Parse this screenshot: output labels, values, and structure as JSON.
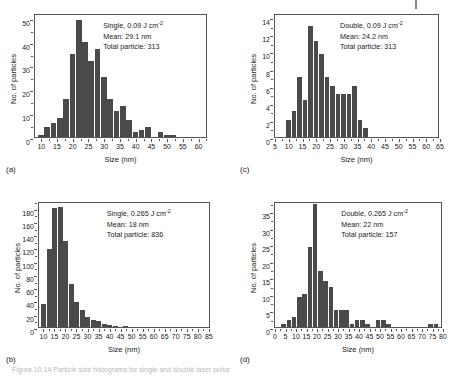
{
  "figure": {
    "caption": "Figure 10.14  Particle size histograms for single and double laser pulse",
    "top_mark": "page-edge-mark"
  },
  "chart_data": [
    {
      "id": "a",
      "type": "bar",
      "panel_letter": "(a)",
      "title": "",
      "xlabel": "Size (nm)",
      "ylabel": "No. of particles",
      "annotation": {
        "condition": "Single, 0.09 J cm",
        "condition_exp": "-2",
        "mean": "Mean: 29.1 nm",
        "total": "Total particle: 313"
      },
      "xlim": [
        8,
        63
      ],
      "ylim": [
        0,
        52
      ],
      "xticks": [
        10,
        15,
        20,
        25,
        30,
        35,
        40,
        45,
        50,
        55,
        60
      ],
      "yticks": [
        0,
        10,
        20,
        30,
        40,
        50
      ],
      "bin_width": 2,
      "bin_starts": [
        9,
        11,
        13,
        15,
        17,
        19,
        21,
        23,
        25,
        27,
        29,
        31,
        33,
        35,
        37,
        39,
        41,
        43,
        45,
        47,
        49,
        51,
        53,
        55,
        57,
        59,
        61
      ],
      "values": [
        1,
        4,
        6,
        8,
        16,
        35,
        49,
        40,
        32,
        37,
        25,
        16,
        11,
        13,
        7,
        2,
        3,
        4,
        0,
        2,
        1,
        1
      ]
    },
    {
      "id": "c",
      "type": "bar",
      "panel_letter": "(c)",
      "title": "",
      "xlabel": "Size (nm)",
      "ylabel": "No. of particles",
      "annotation": {
        "condition": "Double, 0.09 J cm",
        "condition_exp": "-2",
        "mean": "Mean: 24.2 nm",
        "total": "Total particle: 313"
      },
      "xlim": [
        5,
        65
      ],
      "ylim": [
        0,
        14.5
      ],
      "xticks": [
        5,
        10,
        15,
        20,
        25,
        30,
        35,
        40,
        45,
        50,
        55,
        60,
        65
      ],
      "yticks": [
        0,
        2,
        4,
        6,
        8,
        10,
        12,
        14
      ],
      "bin_width": 2,
      "bin_starts": [
        9,
        11,
        13,
        15,
        17,
        19,
        21,
        23,
        25,
        27,
        29,
        31,
        33,
        35,
        37,
        63
      ],
      "values": [
        2,
        3,
        7,
        4.3,
        13,
        11.2,
        9.7,
        7,
        6,
        5,
        5,
        5,
        6,
        2,
        1
      ]
    },
    {
      "id": "b",
      "type": "bar",
      "panel_letter": "(b)",
      "title": "",
      "xlabel": "Size (nm)",
      "ylabel": "No. of particles",
      "annotation": {
        "condition": "Single, 0.265 J cm",
        "condition_exp": "-2",
        "mean": "Mean: 18 nm",
        "total": "Total particle: 836"
      },
      "xlim": [
        8,
        86
      ],
      "ylim": [
        0,
        190
      ],
      "xticks": [
        10,
        15,
        20,
        25,
        30,
        35,
        40,
        45,
        50,
        55,
        60,
        65,
        70,
        75,
        80,
        85
      ],
      "yticks": [
        0,
        20,
        40,
        60,
        80,
        100,
        120,
        140,
        160,
        180
      ],
      "bin_width": 2.5,
      "bin_starts": [
        9,
        11.5,
        14,
        16.5,
        19,
        21.5,
        24,
        26.5,
        29,
        31.5,
        34,
        36.5,
        39,
        41.5,
        46
      ],
      "values": [
        34,
        117,
        180,
        181,
        129,
        65,
        37,
        26,
        15,
        10,
        9,
        4,
        3,
        2,
        2
      ]
    },
    {
      "id": "d",
      "type": "bar",
      "panel_letter": "(d)",
      "title": "",
      "xlabel": "Size (nm)",
      "ylabel": "No. of particles",
      "annotation": {
        "condition": "Double, 0.265 J cm",
        "condition_exp": "-2",
        "mean": "Mean: 22 nm",
        "total": "Total particle: 157"
      },
      "xlim": [
        0,
        80
      ],
      "ylim": [
        0,
        38
      ],
      "xticks": [
        0,
        5,
        10,
        15,
        20,
        25,
        30,
        35,
        40,
        45,
        50,
        55,
        60,
        65,
        70,
        75,
        80
      ],
      "yticks": [
        0,
        5,
        10,
        15,
        20,
        25,
        30,
        35
      ],
      "bin_width": 2.5,
      "bin_starts": [
        3,
        5.5,
        8,
        10.5,
        13,
        15.5,
        18,
        20.5,
        23,
        25.5,
        28,
        30.5,
        33,
        35.5,
        38,
        40.5,
        43,
        48,
        50.5,
        53,
        73,
        75.5
      ],
      "values": [
        1,
        2,
        3,
        9,
        10,
        24,
        37,
        17,
        14,
        12,
        5,
        5,
        5,
        1,
        2,
        2,
        1,
        2,
        2,
        1,
        1,
        1
      ]
    }
  ]
}
